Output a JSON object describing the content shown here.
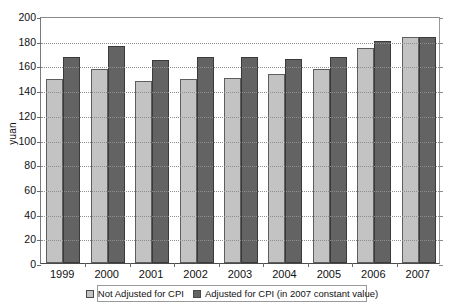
{
  "chart_data": {
    "type": "bar",
    "title": "",
    "xlabel": "",
    "ylabel": "yuan",
    "ylim": [
      0,
      200
    ],
    "ytick_step": 20,
    "yticks": [
      200,
      180,
      160,
      140,
      120,
      100,
      80,
      60,
      40,
      20,
      0
    ],
    "grid": true,
    "legend_position": "bottom",
    "categories": [
      "1999",
      "2000",
      "2001",
      "2002",
      "2003",
      "2004",
      "2005",
      "2006",
      "2007"
    ],
    "series": [
      {
        "name": "Not Adjusted for CPI",
        "color": "#c3c3c3",
        "values": [
          149,
          157,
          147,
          149,
          150,
          153,
          157,
          174,
          183
        ]
      },
      {
        "name": "Adjusted for CPI (in 2007 constant value)",
        "color": "#636363",
        "values": [
          167,
          176,
          164,
          167,
          167,
          165,
          167,
          180,
          183
        ]
      }
    ]
  },
  "axis": {
    "y_title": "yuan"
  },
  "legend": {
    "items": [
      {
        "label": "Not Adjusted for CPI",
        "swatch": "light-gray-swatch-icon"
      },
      {
        "label": "Adjusted for CPI (in 2007 constant value)",
        "swatch": "dark-gray-swatch-icon"
      }
    ]
  }
}
